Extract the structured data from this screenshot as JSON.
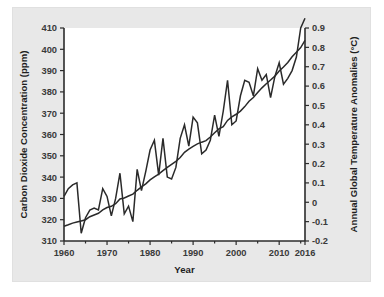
{
  "figure": {
    "panel_bg": "#e8e8e8",
    "plot_bg": "#ffffff",
    "line_color": "#2a2a2a",
    "axis_color": "#2b2b2b"
  },
  "chart_data": {
    "type": "line",
    "title": "",
    "subtitle": "",
    "xlabel": "Year",
    "ylabel": "Carbon Dioxide Concentration (ppm)",
    "y2label": "Annual Global Temperature Anomalies (°C)",
    "grid": false,
    "legend": "none",
    "xlim": [
      1960,
      2016
    ],
    "xticks": [
      1960,
      1970,
      1980,
      1990,
      2000,
      2010,
      2016
    ],
    "xticklabels": [
      "1960",
      "1970",
      "1980",
      "1990",
      "2000",
      "2010",
      "2016"
    ],
    "ylim": [
      310,
      410
    ],
    "yticks": [
      310,
      320,
      330,
      340,
      350,
      360,
      370,
      380,
      390,
      400,
      410
    ],
    "yticklabels": [
      "310",
      "320",
      "330",
      "340",
      "350",
      "360",
      "370",
      "380",
      "390",
      "400",
      "410"
    ],
    "y2lim": [
      -0.2,
      0.9
    ],
    "y2ticks": [
      -0.2,
      -0.1,
      0,
      0.1,
      0.2,
      0.3,
      0.4,
      0.5,
      0.6,
      0.7,
      0.8,
      0.9
    ],
    "y2ticklabels": [
      "-0.2",
      "-0.1",
      "0",
      "0.1",
      "0.2",
      "0.3",
      "0.4",
      "0.5",
      "0.6",
      "0.7",
      "0.8",
      "0.9"
    ],
    "series": [
      {
        "name": "Carbon Dioxide Concentration (ppm)",
        "axis": "left",
        "units": "ppm",
        "x": [
          1960,
          1961,
          1962,
          1963,
          1964,
          1965,
          1966,
          1967,
          1968,
          1969,
          1970,
          1971,
          1972,
          1973,
          1974,
          1975,
          1976,
          1977,
          1978,
          1979,
          1980,
          1981,
          1982,
          1983,
          1984,
          1985,
          1986,
          1987,
          1988,
          1989,
          1990,
          1991,
          1992,
          1993,
          1994,
          1995,
          1996,
          1997,
          1998,
          1999,
          2000,
          2001,
          2002,
          2003,
          2004,
          2005,
          2006,
          2007,
          2008,
          2009,
          2010,
          2011,
          2012,
          2013,
          2014,
          2015,
          2016
        ],
        "y": [
          316.9,
          317.6,
          318.4,
          318.9,
          319.4,
          320.0,
          321.4,
          322.2,
          323.0,
          324.6,
          325.7,
          326.3,
          327.5,
          329.7,
          330.2,
          331.1,
          332.0,
          333.8,
          335.4,
          336.8,
          338.7,
          340.1,
          341.4,
          343.0,
          344.6,
          346.0,
          347.4,
          349.2,
          351.6,
          353.1,
          354.4,
          355.6,
          356.4,
          357.1,
          358.8,
          360.8,
          362.6,
          363.7,
          366.6,
          368.3,
          369.5,
          371.0,
          373.1,
          375.6,
          377.4,
          379.7,
          381.9,
          383.8,
          385.6,
          387.4,
          389.8,
          391.7,
          393.8,
          396.5,
          398.6,
          400.8,
          404.2
        ]
      },
      {
        "name": "Annual Global Temperature Anomalies (°C)",
        "axis": "right",
        "units": "°C",
        "x": [
          1960,
          1961,
          1962,
          1963,
          1964,
          1965,
          1966,
          1967,
          1968,
          1969,
          1970,
          1971,
          1972,
          1973,
          1974,
          1975,
          1976,
          1977,
          1978,
          1979,
          1980,
          1981,
          1982,
          1983,
          1984,
          1985,
          1986,
          1987,
          1988,
          1989,
          1990,
          1991,
          1992,
          1993,
          1994,
          1995,
          1996,
          1997,
          1998,
          1999,
          2000,
          2001,
          2002,
          2003,
          2004,
          2005,
          2006,
          2007,
          2008,
          2009,
          2010,
          2011,
          2012,
          2013,
          2014,
          2015,
          2016
        ],
        "y": [
          0.03,
          0.07,
          0.09,
          0.1,
          -0.16,
          -0.08,
          -0.04,
          -0.03,
          -0.04,
          0.07,
          0.03,
          -0.07,
          0.02,
          0.15,
          -0.06,
          -0.02,
          -0.1,
          0.17,
          0.06,
          0.16,
          0.27,
          0.32,
          0.14,
          0.33,
          0.13,
          0.12,
          0.18,
          0.33,
          0.4,
          0.29,
          0.44,
          0.41,
          0.25,
          0.27,
          0.32,
          0.45,
          0.34,
          0.47,
          0.63,
          0.4,
          0.42,
          0.55,
          0.63,
          0.62,
          0.55,
          0.69,
          0.63,
          0.66,
          0.54,
          0.65,
          0.72,
          0.61,
          0.64,
          0.68,
          0.75,
          0.9,
          0.95
        ]
      }
    ]
  }
}
